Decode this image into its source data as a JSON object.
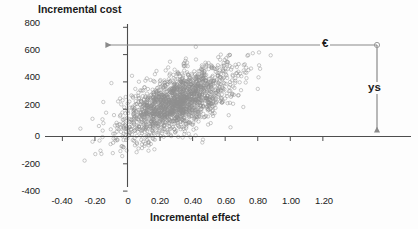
{
  "chart_data": {
    "type": "scatter",
    "title": "",
    "xlabel": "Incremental effect",
    "ylabel": "Incremental cost",
    "xlim": [
      -0.5,
      1.25
    ],
    "ylim": [
      -400,
      800
    ],
    "xticks": [
      "-0.40",
      "-0.20",
      "0",
      "0.20",
      "0.40",
      "0.60",
      "0.80",
      "1.00",
      "1.20"
    ],
    "xtick_values": [
      -0.4,
      -0.2,
      0,
      0.2,
      0.4,
      0.6,
      0.8,
      1.0,
      1.2
    ],
    "yticks": [
      "800",
      "600",
      "400",
      "200",
      "0",
      "-200",
      "-400"
    ],
    "ytick_values": [
      800,
      600,
      400,
      200,
      0,
      -200,
      -400
    ],
    "grid": false,
    "legend": null,
    "marker": {
      "shape": "open-circle",
      "color": "#8e8e8e",
      "size": 3.4,
      "opacity": 0.55
    },
    "cloud": {
      "center_x": 0.3,
      "center_y": 250,
      "spread_x": 0.17,
      "spread_y": 130,
      "correlation": 0.62,
      "n_points": 1800
    },
    "annotations": [
      {
        "name": "ceiling-ratio-corner",
        "x": 1.06,
        "y": 620
      },
      {
        "name": "horizontal-arrow",
        "label": "€",
        "from_x": 1.06,
        "to_x": 0,
        "y": 620,
        "label_x": 0.8
      },
      {
        "name": "vertical-arrow",
        "label": "ys",
        "x": 1.06,
        "from_y": 620,
        "to_y": 0,
        "label_y": 330
      }
    ],
    "axis_color": "#4d4d4d",
    "annotation_color": "#7a7a7a",
    "text_color": "#1b1b1b"
  }
}
